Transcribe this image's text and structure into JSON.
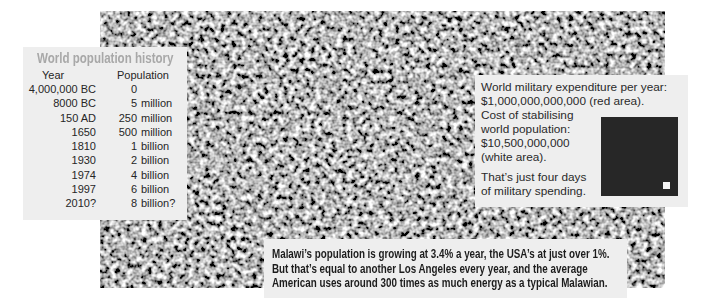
{
  "population_table": {
    "title": "World population history",
    "headers": {
      "year": "Year",
      "population": "Population"
    },
    "rows": [
      {
        "year": "4,000,000 BC",
        "pop_number": "0",
        "pop_unit": ""
      },
      {
        "year": "8000 BC",
        "pop_number": "5",
        "pop_unit": "million"
      },
      {
        "year": "150 AD",
        "pop_number": "250",
        "pop_unit": "million"
      },
      {
        "year": "1650",
        "pop_number": "500",
        "pop_unit": "million"
      },
      {
        "year": "1810",
        "pop_number": "1",
        "pop_unit": "billion"
      },
      {
        "year": "1930",
        "pop_number": "2",
        "pop_unit": "billion"
      },
      {
        "year": "1974",
        "pop_number": "4",
        "pop_unit": "billion"
      },
      {
        "year": "1997",
        "pop_number": "6",
        "pop_unit": "billion"
      },
      {
        "year": "2010?",
        "pop_number": "8",
        "pop_unit": "billion?"
      }
    ]
  },
  "military_box": {
    "lines_top": [
      "World military expenditure per year:",
      "$1,000,000,000,000 (red area)."
    ],
    "lines_side": [
      "Cost of stabilising",
      "world population:",
      "$10,500,000,000",
      "(white area)."
    ],
    "lines_bottom": [
      "That’s just four days",
      "of military spending."
    ]
  },
  "caption": {
    "lines": [
      "Malawi’s population is growing at 3.4% a year, the USA’s at just over 1%.",
      "But that’s equal to another Los Angeles every year, and the average",
      "American uses around 300 times as much energy as a typical Malawian."
    ]
  },
  "colors": {
    "panel_background": "#eeeeee",
    "title_grey": "#a8a8a8",
    "military_area": "#272727",
    "population_area": "#f4f4f4"
  }
}
